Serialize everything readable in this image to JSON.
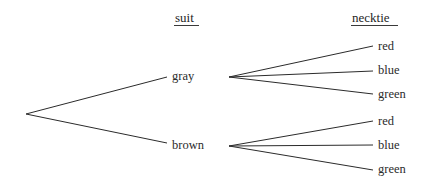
{
  "diagram": {
    "type": "probability-tree-diagram",
    "background_color": "#ffffff",
    "line_color": "#2b2b2b",
    "text_color": "#2b2b2b",
    "headers": [
      {
        "label": "suit",
        "x": 175,
        "y": 11,
        "underline_x": 174,
        "underline_y": 25,
        "underline_w": 25
      },
      {
        "label": "necktie",
        "x": 352,
        "y": 11,
        "underline_x": 351,
        "underline_y": 25,
        "underline_w": 47
      }
    ],
    "root": {
      "x": 26,
      "y": 114
    },
    "stage1_nodes": [
      {
        "label": "gray",
        "text_x": 172,
        "text_y": 70,
        "edge_end_x": 167,
        "edge_end_y": 77,
        "fan_x": 229,
        "fan_y": 77
      },
      {
        "label": "brown",
        "text_x": 172,
        "text_y": 139,
        "edge_end_x": 167,
        "edge_end_y": 143,
        "fan_x": 229,
        "fan_y": 146
      }
    ],
    "stage2_nodes": [
      {
        "label": "red",
        "parent": "gray",
        "text_x": 378,
        "text_y": 40,
        "edge_end_x": 373,
        "edge_end_y": 46
      },
      {
        "label": "blue",
        "parent": "gray",
        "text_x": 378,
        "text_y": 64,
        "edge_end_x": 373,
        "edge_end_y": 71
      },
      {
        "label": "green",
        "parent": "gray",
        "text_x": 378,
        "text_y": 88,
        "edge_end_x": 373,
        "edge_end_y": 94
      },
      {
        "label": "red",
        "parent": "brown",
        "text_x": 378,
        "text_y": 115,
        "edge_end_x": 373,
        "edge_end_y": 121
      },
      {
        "label": "blue",
        "parent": "brown",
        "text_x": 378,
        "text_y": 139,
        "edge_end_x": 373,
        "edge_end_y": 145
      },
      {
        "label": "green",
        "parent": "brown",
        "text_x": 378,
        "text_y": 163,
        "edge_end_x": 373,
        "edge_end_y": 170
      }
    ]
  }
}
